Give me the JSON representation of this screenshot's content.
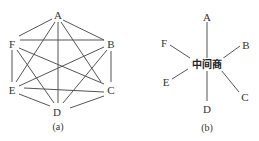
{
  "diagram_a": {
    "caption": "(a)",
    "nodes": [
      {
        "id": "A",
        "label": "A",
        "x": 58,
        "y": 15
      },
      {
        "id": "B",
        "label": "B",
        "x": 111,
        "y": 44
      },
      {
        "id": "C",
        "label": "C",
        "x": 111,
        "y": 90
      },
      {
        "id": "D",
        "label": "D",
        "x": 57,
        "y": 112
      },
      {
        "id": "E",
        "label": "E",
        "x": 12,
        "y": 90
      },
      {
        "id": "F",
        "label": "F",
        "x": 12,
        "y": 44
      }
    ],
    "edges": [
      [
        "A",
        "B"
      ],
      [
        "A",
        "C"
      ],
      [
        "A",
        "D"
      ],
      [
        "A",
        "E"
      ],
      [
        "A",
        "F"
      ],
      [
        "B",
        "C"
      ],
      [
        "B",
        "D"
      ],
      [
        "B",
        "E"
      ],
      [
        "B",
        "F"
      ],
      [
        "C",
        "D"
      ],
      [
        "C",
        "E"
      ],
      [
        "C",
        "F"
      ],
      [
        "D",
        "E"
      ],
      [
        "D",
        "F"
      ],
      [
        "E",
        "F"
      ]
    ]
  },
  "diagram_b": {
    "caption": "(b)",
    "center_label": "中间商",
    "nodes": [
      {
        "id": "A",
        "label": "A",
        "x": 207,
        "y": 17
      },
      {
        "id": "B",
        "label": "B",
        "x": 246,
        "y": 45
      },
      {
        "id": "C",
        "label": "C",
        "x": 245,
        "y": 97
      },
      {
        "id": "D",
        "label": "D",
        "x": 207,
        "y": 109
      },
      {
        "id": "E",
        "label": "E",
        "x": 166,
        "y": 82
      },
      {
        "id": "F",
        "label": "F",
        "x": 164,
        "y": 43
      }
    ]
  }
}
